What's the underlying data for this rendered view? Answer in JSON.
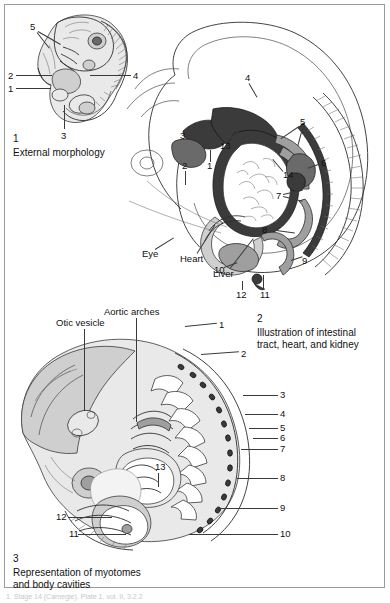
{
  "page": {
    "background_color": "#ffffff",
    "frame_color": "#9a9a9a",
    "footer_text": "1. Stage 14 (Carnegie). Plate 1. vol. II, 3.2.2"
  },
  "panel1": {
    "caption_number": "1",
    "caption_text": "External morphology",
    "leader_numbers": [
      "5",
      "2",
      "1",
      "4",
      "3"
    ]
  },
  "panel2": {
    "caption_number": "2",
    "caption_text": "Illustration of intestinal\ntract, heart, and kidney",
    "leader_numbers": [
      "4",
      "3",
      "13",
      "2",
      "1",
      "5",
      "14",
      "6",
      "7",
      "8",
      "9",
      "10",
      "12",
      "11"
    ],
    "text_labels": [
      "Eye",
      "Heart",
      "Liver"
    ]
  },
  "panel3": {
    "caption_number": "3",
    "caption_text": "Representation of myotomes\nand body cavities",
    "text_labels": [
      "Otic vesicle",
      "Aortic arches"
    ],
    "leader_numbers": [
      "1",
      "2",
      "3",
      "4",
      "5",
      "6",
      "7",
      "8",
      "9",
      "10",
      "11",
      "12",
      "13"
    ]
  }
}
